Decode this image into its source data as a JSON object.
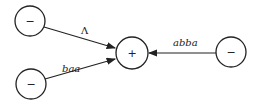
{
  "diagram": {
    "nodes": [
      {
        "id": "n1",
        "symbol": "−",
        "cx": 30,
        "cy": 21,
        "r": 15
      },
      {
        "id": "n2",
        "symbol": "−",
        "cx": 31,
        "cy": 84,
        "r": 15
      },
      {
        "id": "center",
        "symbol": "+",
        "cx": 132,
        "cy": 53,
        "r": 16
      },
      {
        "id": "n3",
        "symbol": "−",
        "cx": 231,
        "cy": 52,
        "r": 15
      }
    ],
    "edges": [
      {
        "from": "n1",
        "to": "center",
        "label": "Λ"
      },
      {
        "from": "n2",
        "to": "center",
        "label": "baa"
      },
      {
        "from": "n3",
        "to": "center",
        "label": "abba"
      }
    ]
  }
}
